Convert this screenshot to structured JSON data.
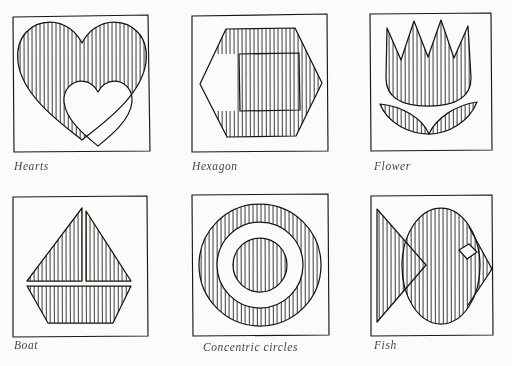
{
  "page": {
    "background_color": "#fbfbf9",
    "ink_color": "#17150f",
    "columns": 3,
    "rows": 2
  },
  "panels": [
    {
      "id": "hearts",
      "caption": "Hearts",
      "shape": "two-overlapping-hearts",
      "fill_style": "vertical-hatch",
      "frame": {
        "x": 12,
        "y": 16,
        "width": 137,
        "height": 136
      },
      "notes": "Large hatched heart at left with a smaller unhatched heart overlapping at lower right"
    },
    {
      "id": "hexagon",
      "caption": "Hexagon",
      "shape": "hexagon-with-square-hole",
      "fill_style": "vertical-hatch",
      "frame": {
        "x": 188,
        "y": 16,
        "width": 140,
        "height": 136
      },
      "notes": "Regular hexagon hatched vertically, with a blank square window at its centre"
    },
    {
      "id": "flower",
      "caption": "Flower",
      "shape": "tulip-with-two-leaves",
      "fill_style": "vertical-hatch",
      "frame": {
        "x": 368,
        "y": 14,
        "width": 132,
        "height": 138
      },
      "notes": "Tulip blossom with three points above two crescent leaves, all hatched"
    },
    {
      "id": "boat",
      "caption": "Boat",
      "shape": "sailboat-two-sails-and-hull",
      "fill_style": "vertical-hatch",
      "frame": {
        "x": 12,
        "y": 198,
        "width": 137,
        "height": 139
      },
      "notes": "Two triangular sails separated by a mast above a trapezoidal hull"
    },
    {
      "id": "concentric-circles",
      "caption": "Concentric circles",
      "shape": "three-concentric-circles",
      "fill_style": "vertical-hatch",
      "frame": {
        "x": 188,
        "y": 196,
        "width": 140,
        "height": 141
      },
      "notes": "Hatched outer annulus, blank middle annulus, hatched inner disc"
    },
    {
      "id": "fish",
      "caption": "Fish",
      "shape": "fish-with-triangular-tail",
      "fill_style": "vertical-hatch",
      "frame": {
        "x": 368,
        "y": 196,
        "width": 132,
        "height": 141
      },
      "notes": "Oval hatched body with triangular tail at left, pointed snout at right and a blank diamond eye"
    }
  ]
}
